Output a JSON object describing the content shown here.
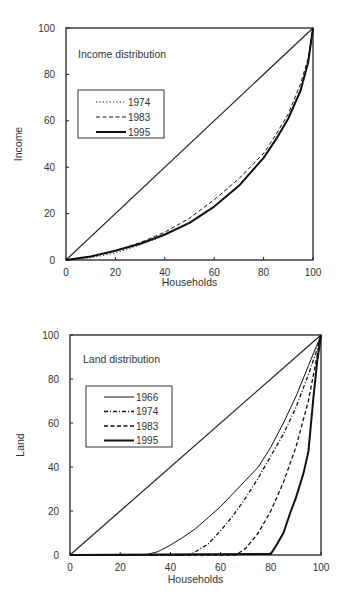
{
  "chart_data": [
    {
      "type": "line",
      "title": "Income distribution",
      "xlabel": "Households",
      "ylabel": "Income",
      "xlim": [
        0,
        100
      ],
      "ylim": [
        0,
        100
      ],
      "xticks": [
        "0",
        "20",
        "40",
        "60",
        "80",
        "100"
      ],
      "yticks": [
        "0",
        "20",
        "40",
        "60",
        "80",
        "100"
      ],
      "grid": false,
      "legend_position": "upper left inside",
      "equality_line": true,
      "series": [
        {
          "name": "1974",
          "style": "dotted",
          "width": 1,
          "x": [
            0,
            10,
            20,
            30,
            40,
            50,
            60,
            70,
            80,
            85,
            90,
            95,
            98,
            100
          ],
          "y": [
            0,
            1,
            3,
            6.5,
            10.5,
            16,
            23,
            32,
            44,
            52,
            61,
            74,
            85,
            100
          ]
        },
        {
          "name": "1983",
          "style": "dashed",
          "width": 1,
          "x": [
            0,
            10,
            20,
            30,
            40,
            50,
            60,
            70,
            80,
            85,
            90,
            95,
            98,
            100
          ],
          "y": [
            0,
            1.5,
            4,
            7.5,
            12,
            18,
            26,
            35,
            46,
            54,
            63,
            76,
            87,
            100
          ]
        },
        {
          "name": "1995",
          "style": "solid-thick",
          "width": 2,
          "x": [
            0,
            10,
            20,
            30,
            40,
            50,
            60,
            70,
            80,
            85,
            90,
            95,
            98,
            100
          ],
          "y": [
            0,
            1.5,
            4,
            7,
            11,
            16,
            23,
            32,
            44,
            52,
            61,
            73,
            85,
            100
          ]
        }
      ]
    },
    {
      "type": "line",
      "title": "Land distribution",
      "xlabel": "Households",
      "ylabel": "Land",
      "xlim": [
        0,
        100
      ],
      "ylim": [
        0,
        100
      ],
      "xticks": [
        "0",
        "20",
        "40",
        "60",
        "80",
        "100"
      ],
      "yticks": [
        "0",
        "20",
        "40",
        "60",
        "80",
        "100"
      ],
      "grid": false,
      "legend_position": "upper left inside",
      "equality_line": true,
      "series": [
        {
          "name": "1966",
          "style": "solid",
          "width": 1,
          "x": [
            0,
            30,
            35,
            40,
            45,
            50,
            55,
            60,
            65,
            70,
            75,
            80,
            85,
            90,
            95,
            100
          ],
          "y": [
            0,
            0,
            1.5,
            4.5,
            8,
            12,
            17,
            22,
            28,
            34,
            40,
            49,
            60,
            72,
            86,
            100
          ]
        },
        {
          "name": "1974",
          "style": "dash-dot",
          "width": 1.3,
          "x": [
            0,
            47,
            50,
            55,
            60,
            65,
            70,
            75,
            80,
            85,
            90,
            95,
            98,
            100
          ],
          "y": [
            0,
            0,
            1.5,
            5,
            11,
            18,
            26,
            35,
            45,
            55,
            67,
            82,
            92,
            100
          ]
        },
        {
          "name": "1983",
          "style": "dashed",
          "width": 1.3,
          "x": [
            0,
            66,
            70,
            75,
            80,
            85,
            90,
            95,
            98,
            100
          ],
          "y": [
            0,
            0,
            3,
            10,
            20,
            33,
            49,
            70,
            88,
            100
          ]
        },
        {
          "name": "1995",
          "style": "solid-thick",
          "width": 2,
          "x": [
            0,
            80,
            82,
            85,
            88,
            90,
            93,
            95,
            97,
            98.5,
            100
          ],
          "y": [
            0,
            0.5,
            4,
            10,
            20,
            26,
            37,
            47,
            72,
            88,
            100
          ]
        }
      ]
    }
  ]
}
